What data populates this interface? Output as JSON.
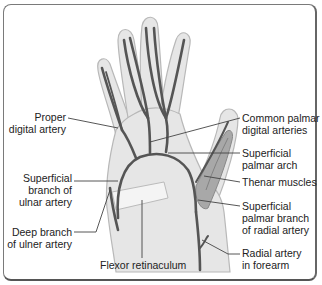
{
  "diagram": {
    "colors": {
      "artery": "#555555",
      "hand_fill": "#e6e6e6",
      "hand_outline": "#b8b8b8",
      "muscle": "#9a9a9a",
      "retinaculum": "#f2f2f2",
      "leader_line": "#444444",
      "frame": "#7a7a7a"
    },
    "labels_left": [
      {
        "id": "proper-digital-artery",
        "lines": [
          "Proper",
          "digital artery"
        ]
      },
      {
        "id": "superficial-branch-ulnar-artery",
        "lines": [
          "Superficial",
          "branch of",
          "ulnar artery"
        ]
      },
      {
        "id": "deep-branch-ulner-artery",
        "lines": [
          "Deep branch",
          "of ulner artery"
        ]
      }
    ],
    "labels_right": [
      {
        "id": "common-palmar-digital-arteries",
        "lines": [
          "Common palmar",
          "digital arteries"
        ]
      },
      {
        "id": "superficial-palmar-arch",
        "lines": [
          "Superficial",
          "palmar arch"
        ]
      },
      {
        "id": "thenar-muscles",
        "lines": [
          "Thenar muscles"
        ]
      },
      {
        "id": "superficial-palmar-branch-radial-artery",
        "lines": [
          "Superficial",
          "palmar branch",
          "of radial artery"
        ]
      },
      {
        "id": "radial-artery-forearm",
        "lines": [
          "Radial artery",
          "in forearm"
        ]
      }
    ],
    "label_bottom": {
      "id": "flexor-retinaculum",
      "lines": [
        "Flexor retinaculum"
      ]
    }
  }
}
